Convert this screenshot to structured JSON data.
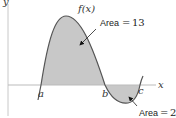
{
  "diagram": {
    "function_label": "f(x)",
    "x_axis_label": "x",
    "y_axis_label": "y",
    "points": {
      "a": "a",
      "b": "b",
      "c": "c"
    },
    "regions": [
      {
        "name": "positive-region",
        "from": "a",
        "to": "b",
        "area_text": "Area",
        "equals": "=",
        "area_value": "13"
      },
      {
        "name": "negative-region",
        "from": "b",
        "to": "c",
        "area_text": "Area",
        "equals": "=",
        "area_value": "2"
      }
    ],
    "colors": {
      "fill": "#c8c8c8",
      "curve": "#555555",
      "axis": "#bbbbbb",
      "arrow": "#222222"
    }
  }
}
